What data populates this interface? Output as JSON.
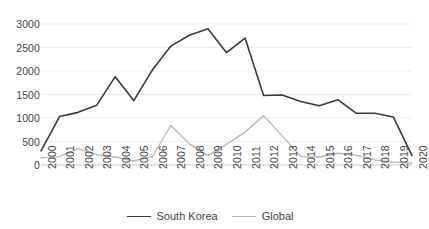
{
  "chart_data": {
    "type": "line",
    "title": "",
    "xlabel": "",
    "ylabel": "",
    "grid": true,
    "legend_position": "bottom",
    "ylim": [
      0,
      3000
    ],
    "yticks": [
      0,
      500,
      1000,
      1500,
      2000,
      2500,
      3000
    ],
    "categories": [
      "2000",
      "2001",
      "2002",
      "2003",
      "2004",
      "2005",
      "2006",
      "2007",
      "2008",
      "2009",
      "2010",
      "2011",
      "2012",
      "2013",
      "2014",
      "2015",
      "2016",
      "2017",
      "2018",
      "2019",
      "2020"
    ],
    "series": [
      {
        "name": "South Korea",
        "color": "#3a3a3a",
        "values": [
          300,
          1030,
          1120,
          1270,
          1880,
          1370,
          2020,
          2530,
          2760,
          2900,
          2390,
          2700,
          1480,
          1490,
          1350,
          1260,
          1390,
          1100,
          1100,
          1020,
          200
        ]
      },
      {
        "name": "Global",
        "color": "#b4b4b4",
        "values": [
          150,
          180,
          350,
          220,
          170,
          90,
          180,
          840,
          450,
          200,
          440,
          700,
          1050,
          620,
          180,
          170,
          250,
          210,
          110,
          60,
          40
        ]
      }
    ]
  },
  "legend": {
    "items": [
      {
        "label": "South Korea",
        "color": "#3a3a3a"
      },
      {
        "label": "Global",
        "color": "#b4b4b4"
      }
    ]
  }
}
